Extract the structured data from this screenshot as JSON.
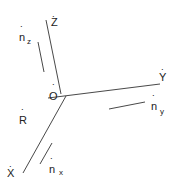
{
  "diagram": {
    "axes": [
      {
        "name": "Z",
        "label": "Z",
        "hat": "˙"
      },
      {
        "name": "Y",
        "label": "Y",
        "hat": "˙"
      },
      {
        "name": "X",
        "label": "X",
        "hat": "˙"
      }
    ],
    "origin": {
      "label": "O",
      "hat": "˙"
    },
    "point_r": {
      "label": "R",
      "hat": "˙"
    },
    "normals": [
      {
        "name": "n_z",
        "base": "n",
        "sub": "z",
        "hat": "˙"
      },
      {
        "name": "n_y",
        "base": "n",
        "sub": "y",
        "hat": "˙"
      },
      {
        "name": "n_x",
        "base": "n",
        "sub": "x",
        "hat": "˙"
      }
    ]
  }
}
